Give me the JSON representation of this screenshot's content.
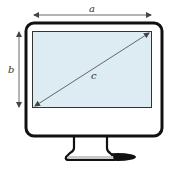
{
  "diagram": {
    "labels": {
      "width": "a",
      "height": "b",
      "diagonal": "c"
    },
    "colors": {
      "screen_fill": "#dcecf2",
      "outline": "#111111",
      "arrow": "#444444",
      "shadow": "#111111",
      "base_fill": "#c8c8c8"
    },
    "elements": [
      {
        "name": "monitor-frame",
        "description": "rounded rectangle bezel"
      },
      {
        "name": "screen",
        "description": "light blue display area"
      },
      {
        "name": "width-arrow",
        "label": "a",
        "description": "double-headed arrow along top edge"
      },
      {
        "name": "height-arrow",
        "label": "b",
        "description": "double-headed arrow along left edge"
      },
      {
        "name": "diagonal-arrow",
        "label": "c",
        "description": "double-headed arrow across screen diagonal"
      },
      {
        "name": "stand",
        "description": "monitor stand with base and shadow"
      }
    ]
  }
}
